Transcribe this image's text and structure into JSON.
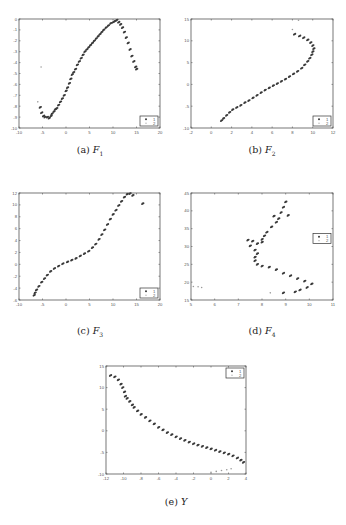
{
  "figure": {
    "captions": [
      {
        "label": "(a)",
        "var": "F",
        "sub": "1"
      },
      {
        "label": "(b)",
        "var": "F",
        "sub": "2"
      },
      {
        "label": "(c)",
        "var": "F",
        "sub": "3"
      },
      {
        "label": "(d)",
        "var": "F",
        "sub": "4"
      },
      {
        "label": "(e)",
        "var": "Y",
        "sub": ""
      }
    ]
  },
  "colors": {
    "series1": "#3a3a3a",
    "series2": "#9a9a9a",
    "frame": "#555555"
  },
  "chart_data": [
    {
      "type": "scatter",
      "title": "(a) F1",
      "xlabel": "",
      "ylabel": "",
      "xlim": [
        -10,
        20
      ],
      "ylim": [
        -10,
        0
      ],
      "xticks": [
        -10,
        -5,
        0,
        5,
        10,
        15,
        20
      ],
      "yticks": [
        -10,
        -9,
        -8,
        -7,
        -6,
        -5,
        -4,
        -3,
        -2,
        -1,
        0
      ],
      "grid": false,
      "legend": {
        "entries": [
          "1",
          "2"
        ],
        "position": "lower right"
      },
      "frame": {
        "x": 19,
        "y": 19,
        "w": 141,
        "h": 109
      },
      "series": [
        {
          "name": "1",
          "points": [
            [
              -5.5,
              -8.1
            ],
            [
              -5.2,
              -8.6
            ],
            [
              -4.8,
              -8.9
            ],
            [
              -4.5,
              -9.0
            ],
            [
              -4.0,
              -9.0
            ],
            [
              -3.6,
              -9.1
            ],
            [
              -3.2,
              -8.9
            ],
            [
              -3.0,
              -8.7
            ],
            [
              -2.6,
              -8.5
            ],
            [
              -2.3,
              -8.3
            ],
            [
              -2.0,
              -8.2
            ],
            [
              -1.6,
              -7.9
            ],
            [
              -1.2,
              -7.6
            ],
            [
              -0.8,
              -7.3
            ],
            [
              -0.4,
              -7.0
            ],
            [
              0.0,
              -6.6
            ],
            [
              0.3,
              -6.3
            ],
            [
              0.7,
              -5.9
            ],
            [
              1.0,
              -5.5
            ],
            [
              1.3,
              -5.1
            ],
            [
              1.6,
              -4.9
            ],
            [
              2.0,
              -4.6
            ],
            [
              2.4,
              -4.2
            ],
            [
              2.8,
              -3.9
            ],
            [
              3.2,
              -3.6
            ],
            [
              3.6,
              -3.3
            ],
            [
              4.0,
              -3.0
            ],
            [
              4.4,
              -2.8
            ],
            [
              4.8,
              -2.6
            ],
            [
              5.2,
              -2.4
            ],
            [
              5.6,
              -2.2
            ],
            [
              6.0,
              -2.0
            ],
            [
              6.4,
              -1.8
            ],
            [
              6.8,
              -1.6
            ],
            [
              7.2,
              -1.4
            ],
            [
              7.6,
              -1.2
            ],
            [
              8.0,
              -1.0
            ],
            [
              8.5,
              -0.8
            ],
            [
              9.0,
              -0.6
            ],
            [
              9.5,
              -0.4
            ],
            [
              10.0,
              -0.3
            ],
            [
              10.4,
              -0.2
            ],
            [
              10.8,
              -0.1
            ],
            [
              11.2,
              -0.3
            ],
            [
              11.6,
              -0.5
            ],
            [
              12.0,
              -0.8
            ],
            [
              12.4,
              -1.2
            ],
            [
              12.8,
              -1.7
            ],
            [
              13.2,
              -2.2
            ],
            [
              13.6,
              -2.8
            ],
            [
              14.0,
              -3.4
            ],
            [
              14.4,
              -3.9
            ],
            [
              14.8,
              -4.4
            ],
            [
              15.0,
              -4.6
            ]
          ]
        },
        {
          "name": "2",
          "points": [
            [
              -6.0,
              -7.6
            ],
            [
              -5.3,
              -4.4
            ]
          ]
        }
      ]
    },
    {
      "type": "scatter",
      "title": "(b) F2",
      "xlabel": "",
      "ylabel": "",
      "xlim": [
        -2,
        12
      ],
      "ylim": [
        -10,
        15
      ],
      "xticks": [
        -2,
        0,
        2,
        4,
        6,
        8,
        10,
        12
      ],
      "yticks": [
        -10,
        -5,
        0,
        5,
        10,
        15
      ],
      "grid": false,
      "legend": {
        "entries": [
          "1",
          "2"
        ],
        "position": "lower right"
      },
      "frame": {
        "x": 191,
        "y": 19,
        "w": 142,
        "h": 109
      },
      "series": [
        {
          "name": "1",
          "points": [
            [
              1.0,
              -8.3
            ],
            [
              1.2,
              -7.8
            ],
            [
              1.5,
              -7.1
            ],
            [
              1.8,
              -6.4
            ],
            [
              2.1,
              -5.8
            ],
            [
              2.5,
              -5.3
            ],
            [
              2.9,
              -4.8
            ],
            [
              3.3,
              -4.2
            ],
            [
              3.7,
              -3.7
            ],
            [
              4.1,
              -3.1
            ],
            [
              4.5,
              -2.5
            ],
            [
              4.9,
              -1.9
            ],
            [
              5.3,
              -1.3
            ],
            [
              5.7,
              -0.8
            ],
            [
              6.1,
              -0.3
            ],
            [
              6.5,
              0.2
            ],
            [
              6.9,
              0.7
            ],
            [
              7.3,
              1.2
            ],
            [
              7.7,
              1.8
            ],
            [
              8.1,
              2.4
            ],
            [
              8.5,
              3.0
            ],
            [
              8.9,
              3.7
            ],
            [
              9.2,
              4.5
            ],
            [
              9.5,
              5.3
            ],
            [
              9.7,
              6.0
            ],
            [
              9.9,
              6.8
            ],
            [
              10.0,
              7.5
            ],
            [
              10.1,
              8.2
            ],
            [
              10.0,
              8.9
            ],
            [
              9.8,
              9.6
            ],
            [
              9.5,
              10.2
            ],
            [
              9.1,
              10.7
            ],
            [
              8.7,
              11.1
            ],
            [
              8.2,
              11.5
            ]
          ]
        },
        {
          "name": "2",
          "points": [
            [
              8.0,
              12.6
            ],
            [
              8.6,
              14.7
            ]
          ]
        }
      ]
    },
    {
      "type": "scatter",
      "title": "(c) F3",
      "xlabel": "",
      "ylabel": "",
      "xlim": [
        -10,
        20
      ],
      "ylim": [
        -6,
        12
      ],
      "xticks": [
        -10,
        -5,
        0,
        5,
        10,
        15,
        20
      ],
      "yticks": [
        -6,
        -4,
        -2,
        0,
        2,
        4,
        6,
        8,
        10,
        12
      ],
      "grid": false,
      "legend": {
        "entries": [
          "1",
          "2"
        ],
        "position": "lower right"
      },
      "frame": {
        "x": 19,
        "y": 193,
        "w": 141,
        "h": 107
      },
      "series": [
        {
          "name": "1",
          "points": [
            [
              -6.8,
              -5.2
            ],
            [
              -6.6,
              -4.8
            ],
            [
              -6.3,
              -4.3
            ],
            [
              -5.8,
              -3.7
            ],
            [
              -5.2,
              -3.0
            ],
            [
              -4.6,
              -2.4
            ],
            [
              -4.0,
              -1.8
            ],
            [
              -3.3,
              -1.2
            ],
            [
              -2.5,
              -0.7
            ],
            [
              -1.6,
              -0.3
            ],
            [
              -0.7,
              0.1
            ],
            [
              0.3,
              0.4
            ],
            [
              1.2,
              0.7
            ],
            [
              2.1,
              1.0
            ],
            [
              3.0,
              1.4
            ],
            [
              3.9,
              1.8
            ],
            [
              4.8,
              2.2
            ],
            [
              5.6,
              2.8
            ],
            [
              6.3,
              3.4
            ],
            [
              7.0,
              4.2
            ],
            [
              7.6,
              5.0
            ],
            [
              8.2,
              5.8
            ],
            [
              8.8,
              6.7
            ],
            [
              9.4,
              7.6
            ],
            [
              10.0,
              8.4
            ],
            [
              10.6,
              9.1
            ],
            [
              11.2,
              9.9
            ],
            [
              11.8,
              10.6
            ],
            [
              12.4,
              11.3
            ],
            [
              13.0,
              11.8
            ],
            [
              13.6,
              11.9
            ],
            [
              14.2,
              11.6
            ],
            [
              16.3,
              10.2
            ]
          ]
        },
        {
          "name": "2",
          "points": []
        }
      ]
    },
    {
      "type": "scatter",
      "title": "(d) F4",
      "xlabel": "",
      "ylabel": "",
      "xlim": [
        5,
        11
      ],
      "ylim": [
        15,
        45
      ],
      "xticks": [
        5,
        6,
        7,
        8,
        9,
        10,
        11
      ],
      "yticks": [
        15,
        20,
        25,
        30,
        35,
        40,
        45
      ],
      "grid": false,
      "legend": {
        "entries": [
          "1",
          "2"
        ],
        "position": "middle right"
      },
      "frame": {
        "x": 191,
        "y": 193,
        "w": 142,
        "h": 107
      },
      "series": [
        {
          "name": "1",
          "points": [
            [
              9.0,
              42.5
            ],
            [
              8.9,
              41.0
            ],
            [
              8.8,
              39.5
            ],
            [
              9.1,
              38.7
            ],
            [
              8.7,
              37.8
            ],
            [
              8.5,
              38.5
            ],
            [
              8.6,
              36.8
            ],
            [
              8.4,
              35.5
            ],
            [
              8.2,
              34.0
            ],
            [
              8.1,
              33.0
            ],
            [
              8.0,
              32.0
            ],
            [
              8.0,
              31.2
            ],
            [
              7.8,
              30.8
            ],
            [
              7.6,
              31.5
            ],
            [
              7.4,
              31.8
            ],
            [
              7.5,
              30.2
            ],
            [
              7.7,
              29.0
            ],
            [
              7.8,
              28.0
            ],
            [
              7.7,
              27.0
            ],
            [
              7.7,
              26.0
            ],
            [
              7.8,
              25.0
            ],
            [
              8.0,
              24.5
            ],
            [
              8.3,
              24.2
            ],
            [
              8.6,
              23.5
            ],
            [
              8.9,
              22.5
            ],
            [
              9.2,
              21.8
            ],
            [
              9.5,
              21.0
            ],
            [
              9.8,
              20.3
            ],
            [
              10.1,
              19.5
            ],
            [
              9.9,
              18.5
            ],
            [
              9.6,
              17.8
            ],
            [
              9.4,
              17.3
            ],
            [
              8.9,
              17.0
            ]
          ]
        },
        {
          "name": "2",
          "points": [
            [
              5.1,
              18.8
            ],
            [
              5.3,
              18.7
            ],
            [
              5.45,
              18.5
            ],
            [
              8.35,
              17.0
            ]
          ]
        }
      ]
    },
    {
      "type": "scatter",
      "title": "(e) Y",
      "xlabel": "",
      "ylabel": "",
      "xlim": [
        -12,
        4
      ],
      "ylim": [
        -10,
        15
      ],
      "xticks": [
        -12,
        -10,
        -8,
        -6,
        -4,
        -2,
        0,
        2,
        4
      ],
      "yticks": [
        -10,
        -5,
        0,
        5,
        10,
        15
      ],
      "grid": false,
      "legend": {
        "entries": [
          "1",
          "2"
        ],
        "position": "upper right"
      },
      "frame": {
        "x": 106,
        "y": 366,
        "w": 140,
        "h": 108
      },
      "series": [
        {
          "name": "1",
          "points": [
            [
              -11.5,
              12.8
            ],
            [
              -11.0,
              12.5
            ],
            [
              -10.6,
              11.8
            ],
            [
              -10.3,
              10.8
            ],
            [
              -10.1,
              10.0
            ],
            [
              -9.9,
              9.0
            ],
            [
              -9.8,
              8.0
            ],
            [
              -9.6,
              7.5
            ],
            [
              -9.3,
              6.8
            ],
            [
              -9.0,
              6.0
            ],
            [
              -8.8,
              5.4
            ],
            [
              -8.4,
              4.6
            ],
            [
              -8.0,
              3.8
            ],
            [
              -7.5,
              3.1
            ],
            [
              -7.0,
              2.3
            ],
            [
              -6.5,
              1.6
            ],
            [
              -6.0,
              0.8
            ],
            [
              -5.5,
              0.2
            ],
            [
              -5.0,
              -0.4
            ],
            [
              -4.5,
              -0.9
            ],
            [
              -4.0,
              -1.4
            ],
            [
              -3.5,
              -1.8
            ],
            [
              -3.0,
              -2.2
            ],
            [
              -2.5,
              -2.6
            ],
            [
              -2.0,
              -3.0
            ],
            [
              -1.5,
              -3.3
            ],
            [
              -1.0,
              -3.6
            ],
            [
              -0.5,
              -3.9
            ],
            [
              0.0,
              -4.2
            ],
            [
              0.5,
              -4.5
            ],
            [
              1.0,
              -4.8
            ],
            [
              1.5,
              -5.1
            ],
            [
              2.0,
              -5.4
            ],
            [
              2.5,
              -5.8
            ],
            [
              3.0,
              -6.3
            ],
            [
              3.4,
              -6.8
            ],
            [
              3.7,
              -7.3
            ]
          ]
        },
        {
          "name": "2",
          "points": [
            [
              0.0,
              -9.6
            ],
            [
              0.6,
              -9.4
            ],
            [
              1.2,
              -9.2
            ],
            [
              1.8,
              -9.0
            ],
            [
              2.3,
              -8.8
            ]
          ]
        }
      ]
    }
  ]
}
